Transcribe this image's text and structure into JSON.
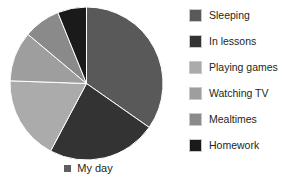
{
  "chart_data": {
    "type": "pie",
    "title": "",
    "subtitle": "",
    "xlabel": "",
    "ylabel": "",
    "series_name": "My day",
    "legend_position": "right",
    "grid": false,
    "categories": [
      "Sleeping",
      "In lessons",
      "Playing games",
      "Watching TV",
      "Mealtimes",
      "Homework"
    ],
    "values": [
      34.7,
      23.1,
      17.8,
      10.6,
      7.8,
      6.1
    ],
    "unit": "percent",
    "start_angle_deg": 0,
    "direction": "clockwise",
    "slices": [
      {
        "label": "Sleeping",
        "value": 34.7,
        "start_deg": 0,
        "end_deg": 125,
        "color": "#595959"
      },
      {
        "label": "In lessons",
        "value": 23.1,
        "start_deg": 125,
        "end_deg": 208,
        "color": "#333333"
      },
      {
        "label": "Playing games",
        "value": 17.8,
        "start_deg": 208,
        "end_deg": 272,
        "color": "#ababab"
      },
      {
        "label": "Watching TV",
        "value": 10.6,
        "start_deg": 272,
        "end_deg": 310,
        "color": "#9e9e9e"
      },
      {
        "label": "Mealtimes",
        "value": 7.8,
        "start_deg": 310,
        "end_deg": 338,
        "color": "#8a8a8a"
      },
      {
        "label": "Homework",
        "value": 6.1,
        "start_deg": 338,
        "end_deg": 360,
        "color": "#1a1a1a"
      }
    ]
  },
  "legend": {
    "items": [
      {
        "label": "Sleeping",
        "color": "#595959"
      },
      {
        "label": "In lessons",
        "color": "#333333"
      },
      {
        "label": "Playing games",
        "color": "#ababab"
      },
      {
        "label": "Watching TV",
        "color": "#9e9e9e"
      },
      {
        "label": "Mealtimes",
        "color": "#8a8a8a"
      },
      {
        "label": "Homework",
        "color": "#1a1a1a"
      }
    ]
  },
  "caption": {
    "label": "My day",
    "marker_color": "#5f5f5f"
  },
  "style": {
    "background": "#ffffff",
    "text_color": "#231f20",
    "slice_edge_color": "#ffffff"
  }
}
